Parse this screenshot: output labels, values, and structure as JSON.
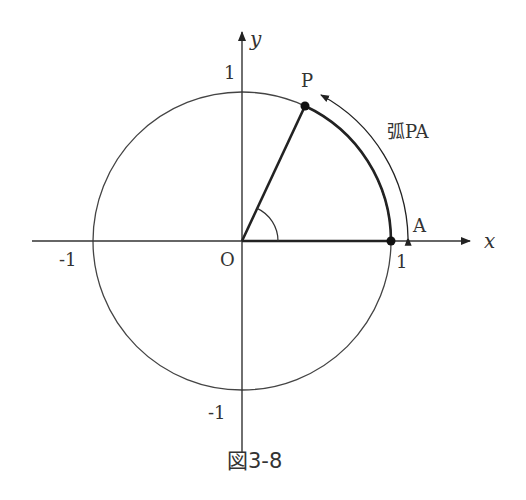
{
  "figure": {
    "caption": "図3-8",
    "angle_deg": 65
  },
  "axes": {
    "x_label": "x",
    "y_label": "y",
    "origin_label": "O",
    "x_ticks": [
      "-1",
      "1"
    ],
    "y_ticks": [
      "1",
      "-1"
    ]
  },
  "points": {
    "P": "P",
    "A": "A"
  },
  "arc_label": "弧PA",
  "colors": {
    "line": "#333333",
    "thick": "#222222"
  }
}
